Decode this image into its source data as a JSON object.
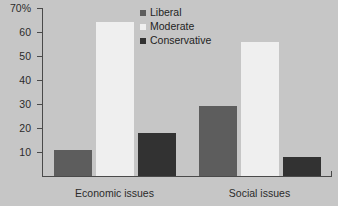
{
  "chart_data": {
    "type": "bar",
    "title": "",
    "xlabel": "",
    "ylabel": "",
    "categories": [
      "Economic issues",
      "Social issues"
    ],
    "series": [
      {
        "name": "Liberal",
        "color": "#5d5d5d",
        "values": [
          11,
          29
        ]
      },
      {
        "name": "Moderate",
        "color": "#efefef",
        "values": [
          64,
          56
        ]
      },
      {
        "name": "Conservative",
        "color": "#323232",
        "values": [
          18,
          8
        ]
      }
    ],
    "ylim": [
      0,
      70
    ],
    "yticks": [
      0,
      10,
      20,
      30,
      40,
      50,
      60,
      70
    ],
    "ytick_labels": [
      "",
      "10",
      "20",
      "30",
      "40",
      "50",
      "60",
      "70%"
    ],
    "grid": false,
    "legend_position": "top-center",
    "background_color": "#c6c6c6"
  },
  "axis": {
    "y_labels": [
      "70%",
      "60",
      "50",
      "40",
      "30",
      "20",
      "10"
    ],
    "y_values": [
      70,
      60,
      50,
      40,
      30,
      20,
      10
    ]
  },
  "legend": {
    "items": [
      {
        "label": "Liberal"
      },
      {
        "label": "Moderate"
      },
      {
        "label": "Conservative"
      }
    ]
  }
}
